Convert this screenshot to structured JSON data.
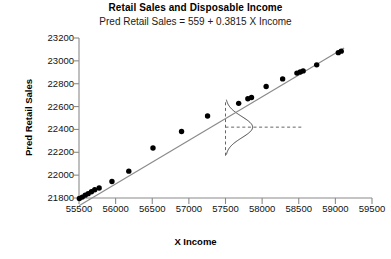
{
  "chart_data": {
    "type": "scatter",
    "title": "Retail Sales and Disposable Income",
    "subtitle": "Pred Retail Sales  =  559  +  0.3815 X  Income",
    "xlabel": "X  Income",
    "ylabel": "Pred Retail Sales",
    "xlim": [
      55500,
      59500
    ],
    "ylim": [
      21800,
      23200
    ],
    "xticks": [
      55500,
      56000,
      56500,
      57000,
      57500,
      58000,
      58500,
      59000,
      59500
    ],
    "yticks": [
      21800,
      22000,
      22200,
      22400,
      22600,
      22800,
      23000,
      23200
    ],
    "grid": false,
    "legend": "none",
    "series": [
      {
        "name": "Pred Retail Sales",
        "marker": "filled-circle",
        "color": "#000000",
        "points": [
          {
            "x": 55505,
            "y": 21795
          },
          {
            "x": 55545,
            "y": 21808
          },
          {
            "x": 55585,
            "y": 21825
          },
          {
            "x": 55625,
            "y": 21838
          },
          {
            "x": 55670,
            "y": 21855
          },
          {
            "x": 55715,
            "y": 21872
          },
          {
            "x": 55775,
            "y": 21888
          },
          {
            "x": 55950,
            "y": 21945
          },
          {
            "x": 56180,
            "y": 22035
          },
          {
            "x": 56510,
            "y": 22238
          },
          {
            "x": 56900,
            "y": 22382
          },
          {
            "x": 57255,
            "y": 22517
          },
          {
            "x": 57680,
            "y": 22628
          },
          {
            "x": 57805,
            "y": 22668
          },
          {
            "x": 57855,
            "y": 22680
          },
          {
            "x": 58055,
            "y": 22775
          },
          {
            "x": 58280,
            "y": 22842
          },
          {
            "x": 58475,
            "y": 22893
          },
          {
            "x": 58520,
            "y": 22903
          },
          {
            "x": 58560,
            "y": 22912
          },
          {
            "x": 58745,
            "y": 22965
          },
          {
            "x": 59040,
            "y": 23072
          },
          {
            "x": 59080,
            "y": 23085
          }
        ]
      }
    ],
    "regression_line": {
      "intercept": 559,
      "slope": 0.3815,
      "color": "#8a8a8a",
      "x_start": 55500,
      "x_end": 59120
    },
    "annotations": {
      "normal_curve": {
        "label": "normal-distribution-curve",
        "center_x": 57500,
        "center_y": 22420,
        "baseline_x": 57500,
        "y_min": 22180,
        "y_max": 22660,
        "peak_width_x": 370
      },
      "vertical_reference_line": {
        "label": "vertical-dashed-line",
        "x": 57500,
        "y_min": 22170,
        "y_max": 22660,
        "style": "dashed"
      },
      "horizontal_reference_line": {
        "label": "horizontal-dashed-line",
        "y": 22420,
        "x_min": 57500,
        "x_max": 58570,
        "style": "dashed"
      }
    }
  }
}
